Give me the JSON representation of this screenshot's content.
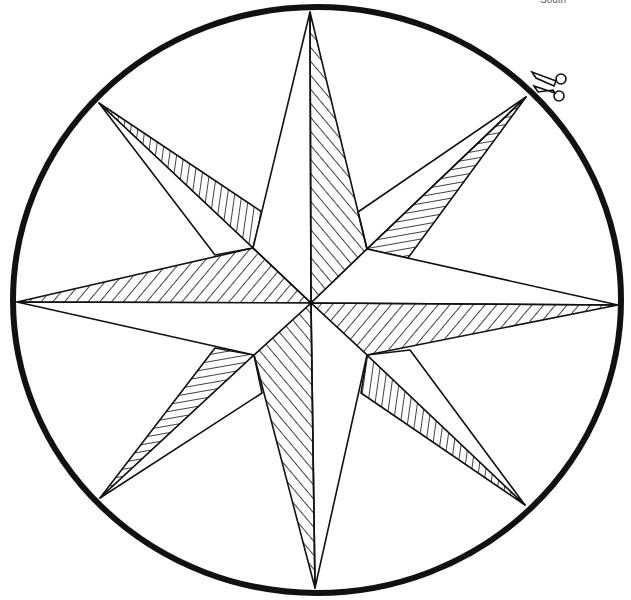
{
  "page": {
    "corner_label": "South"
  },
  "colors": {
    "line": "#111111",
    "background": "#ffffff",
    "label": "#666666"
  },
  "figure": {
    "type": "compass-rose",
    "points": 8,
    "center": [
      311,
      303
    ],
    "circle": {
      "cx": 317,
      "cy": 300,
      "rx": 304,
      "ry": 293
    },
    "main_tips": {
      "N": [
        310,
        12
      ],
      "E": [
        618,
        305
      ],
      "S": [
        315,
        588
      ],
      "W": [
        17,
        302
      ]
    },
    "inner_vertices": {
      "NE": [
        367,
        249
      ],
      "SE": [
        367,
        355
      ],
      "SW": [
        254,
        355
      ],
      "NW": [
        253,
        248
      ]
    },
    "secondary_tips": {
      "NE": [
        526,
        97
      ],
      "SE": [
        525,
        505
      ],
      "SW": [
        100,
        498
      ],
      "NW": [
        99,
        103
      ]
    }
  },
  "icons": {
    "scissors": "scissors-icon"
  }
}
